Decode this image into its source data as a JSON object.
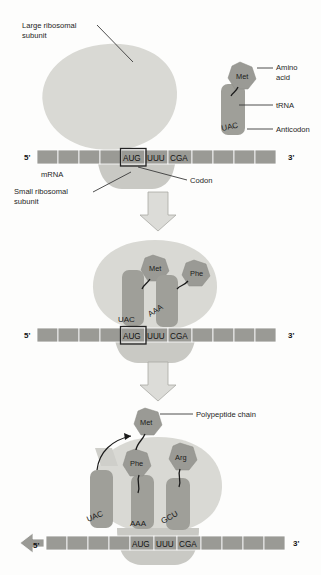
{
  "figure": {
    "type": "diagram",
    "panel_count": 3
  },
  "colors": {
    "background": "#fdfdfc",
    "mrna_segment": "#9a9a95",
    "large_subunit": "#d9d9d4",
    "small_subunit": "#c9c9c4",
    "trna": "#9f9f99",
    "amino_acid": "#9a9a95",
    "flow_arrow_fill": "#dcdcd8",
    "text": "#1d1d1d",
    "codon_box_stroke": "#232323"
  },
  "labels": {
    "large_ribosomal_subunit_line1": "Large ribosomal",
    "large_ribosomal_subunit_line2": "subunit",
    "small_ribosomal_subunit_line1": "Small ribosomal",
    "small_ribosomal_subunit_line2": "subunit",
    "amino_acid_line1": "Amino",
    "amino_acid_line2": "acid",
    "trna": "tRNA",
    "anticodon": "Anticodon",
    "mrna": "mRNA",
    "codon": "Codon",
    "polypeptide_chain": "Polypeptide chain"
  },
  "mrna": {
    "five_prime": "5'",
    "three_prime": "3'",
    "coding_codons": [
      "AUG",
      "UUU",
      "CGA"
    ],
    "blank_segments_left": 4,
    "blank_segments_right": 4,
    "boxed_codon": "AUG"
  },
  "panel1": {
    "name": "initiation",
    "trna": {
      "anticodon": "UAC",
      "amino_acid": "Met"
    }
  },
  "panel2": {
    "name": "elongation-first-trna-pair",
    "trnas": [
      {
        "anticodon": "UAC",
        "amino_acid": "Met"
      },
      {
        "anticodon": "AAA",
        "amino_acid": "Phe"
      }
    ]
  },
  "panel3": {
    "name": "elongation-peptide-transfer",
    "trnas": [
      {
        "anticodon": "UAC",
        "amino_acid": ""
      },
      {
        "anticodon": "AAA",
        "amino_acid": "Phe"
      },
      {
        "anticodon": "GCU",
        "amino_acid": "Arg"
      }
    ],
    "polypeptide": [
      "Met",
      "Phe"
    ],
    "translocation_direction": "5'",
    "five_prime_arrow": true
  }
}
